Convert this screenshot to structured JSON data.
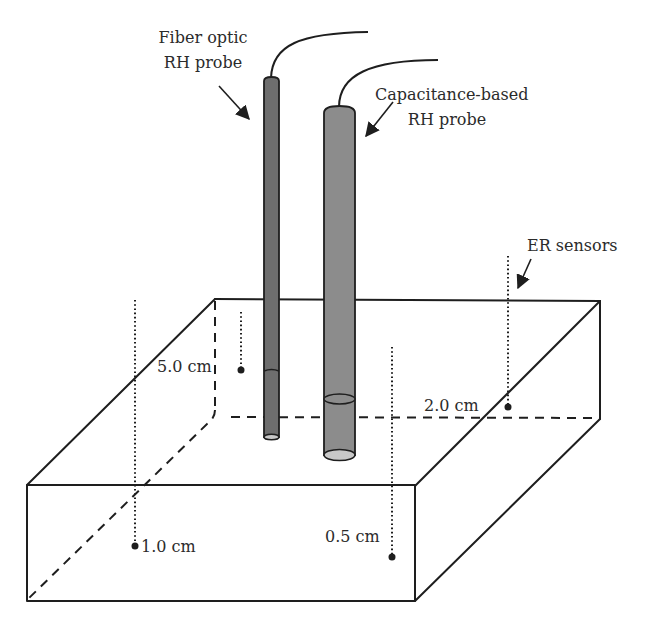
{
  "figure": {
    "type": "schematic"
  },
  "labels": {
    "fiber_probe": [
      "Fiber optic",
      "RH probe"
    ],
    "capacitance_probe": [
      "Capacitance-based",
      "RH probe"
    ],
    "er_sensors": "ER sensors"
  },
  "sensors": [
    {
      "id": "s1",
      "depth_label": "1.0 cm"
    },
    {
      "id": "s2",
      "depth_label": "0.5 cm"
    },
    {
      "id": "s3",
      "depth_label": "5.0 cm"
    },
    {
      "id": "s4",
      "depth_label": "2.0 cm"
    }
  ],
  "colors": {
    "fiber_probe_fill": "#6e6e6e",
    "capacitance_probe_fill": "#8c8c8c",
    "probe_end_fill": "#c8c8c8",
    "line": "#1e1e1e",
    "background": "#ffffff"
  }
}
